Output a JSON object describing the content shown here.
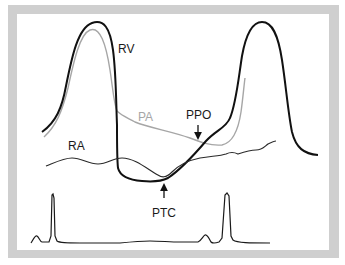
{
  "diagram": {
    "type": "hemodynamic pressure waveform diagram",
    "colors": {
      "frame": "#cfcfcf",
      "panel": "#ffffff",
      "rv": "#111111",
      "pa": "#a6a6a6",
      "ra": "#2a2a2a",
      "ecg": "#1a1a1a"
    },
    "traces": [
      {
        "id": "rv",
        "label": "RV",
        "description": "Right ventricular pressure"
      },
      {
        "id": "pa",
        "label": "PA",
        "description": "Pulmonary artery pressure"
      },
      {
        "id": "ra",
        "label": "RA",
        "description": "Right atrial pressure"
      },
      {
        "id": "ecg",
        "label": "",
        "description": "ECG tracing"
      }
    ],
    "annotations": [
      {
        "id": "ppo",
        "label": "PPO",
        "arrow": "down"
      },
      {
        "id": "ptc",
        "label": "PTC",
        "arrow": "up"
      }
    ]
  },
  "labels": {
    "rv": "RV",
    "pa": "PA",
    "ra": "RA",
    "ppo": "PPO",
    "ptc": "PTC"
  }
}
